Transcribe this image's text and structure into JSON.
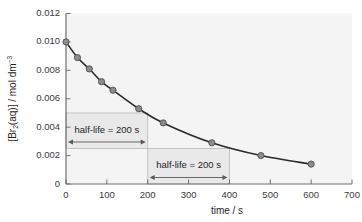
{
  "chart_data": {
    "type": "line",
    "title": "",
    "xlabel": "time / s",
    "ylabel": "[Br2(aq)] / mol dm-3",
    "ylabel_parts": {
      "lead": "[Br",
      "sub": "2",
      "mid": "(aq)] / mol dm",
      "sup": "−3"
    },
    "xlim": [
      0,
      700
    ],
    "ylim": [
      0,
      0.012
    ],
    "xticks": [
      0,
      100,
      200,
      300,
      400,
      500,
      600,
      700
    ],
    "xtick_labels": [
      "0",
      "100",
      "200",
      "300",
      "400",
      "500",
      "600",
      "700"
    ],
    "yticks": [
      0,
      0.002,
      0.004,
      0.006,
      0.008,
      0.01,
      0.012
    ],
    "ytick_labels": [
      "0",
      "0.002",
      "0.004",
      "0.006",
      "0.008",
      "0.010",
      "0.012"
    ],
    "grid": false,
    "legend": null,
    "x": [
      0,
      28,
      57,
      87,
      115,
      178,
      238,
      357,
      477,
      600
    ],
    "y": [
      0.01,
      0.0089,
      0.0081,
      0.0072,
      0.0066,
      0.0053,
      0.0043,
      0.0029,
      0.002,
      0.0014
    ],
    "series": [
      {
        "name": "[Br2(aq)]",
        "marker": "circle",
        "marker_color": "#8a8a8a",
        "line_color": "#2b2b2b",
        "values": [
          0.01,
          0.0089,
          0.0081,
          0.0072,
          0.0066,
          0.0053,
          0.0043,
          0.0029,
          0.002,
          0.0014
        ]
      }
    ],
    "annotations": [
      {
        "id": "half-life-1",
        "text": "half-life = 200 s",
        "x_start": 0,
        "x_end": 200,
        "y_top": 0.005,
        "y_bottom": 0.0025,
        "arrow": "double-headed"
      },
      {
        "id": "half-life-2",
        "text": "half-life = 200 s",
        "x_start": 200,
        "x_end": 400,
        "y_top": 0.0025,
        "y_bottom": 0.0,
        "arrow": "double-headed"
      }
    ],
    "colors": {
      "plot_background": "#f4f4f4",
      "axis": "#6e6e6e",
      "curve": "#2b2b2b",
      "marker_fill": "#8c8c8c",
      "marker_stroke": "#4d4d4d",
      "annotation_band": "#e9e9e9",
      "annotation_border": "#b9b9b9",
      "text": "#1d1d1d",
      "tick_text": "#3a3a3a"
    }
  }
}
